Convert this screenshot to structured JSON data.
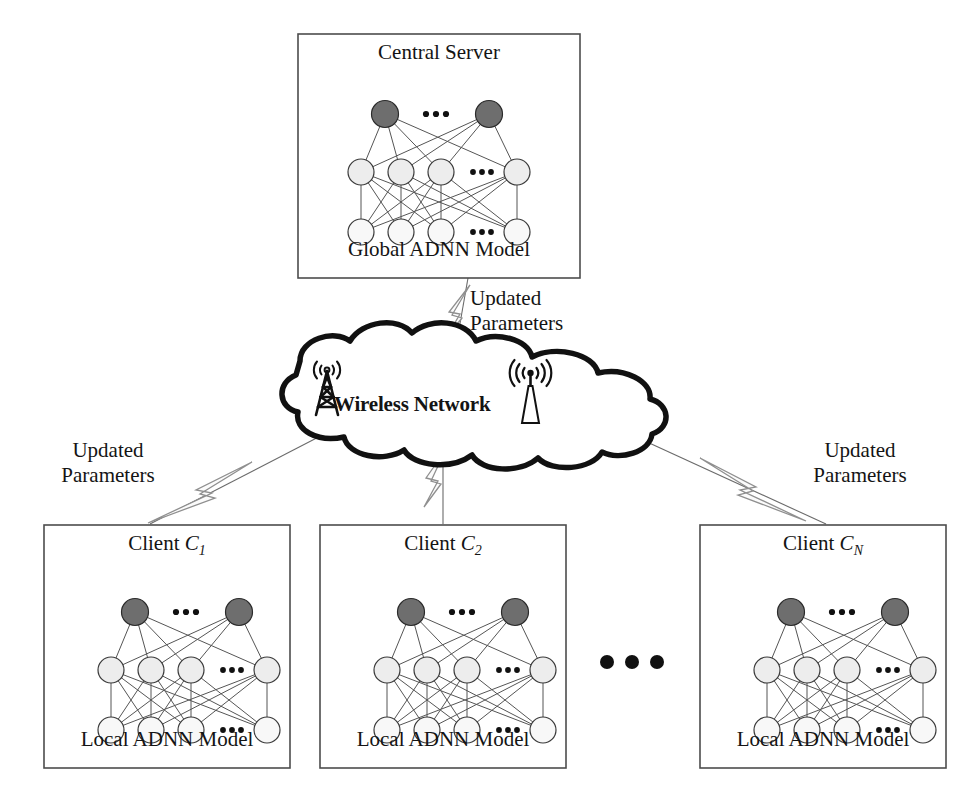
{
  "diagram": {
    "title_semantic": "federated-learning-over-wireless-network",
    "colors": {
      "stroke": "#1a1a1a",
      "box_border": "#4a4a4a",
      "node_dark": "#6e6e6e",
      "node_light": "#ececec",
      "node_lighter": "#f7f7f7",
      "bolt_stroke": "#8a8a8a",
      "link_stroke": "#555555",
      "background": "#ffffff"
    }
  },
  "server": {
    "title": "Central Server",
    "caption": "Global ADNN Model",
    "ellipsis": "•••"
  },
  "network": {
    "label": "Wireless Network",
    "tower_lattice_icon": "cell-tower-icon",
    "tower_mast_icon": "antenna-mast-icon",
    "cloud_icon": "cloud-shape-icon"
  },
  "links": {
    "to_server": {
      "label_line1": "Updated",
      "label_line2": "Parameters",
      "bolt_icon": "lightning-bolt-icon"
    },
    "to_client_1": {
      "label_line1": "Updated",
      "label_line2": "Parameters",
      "bolt_icon": "lightning-bolt-icon"
    },
    "to_client_2": {
      "label_line1": "",
      "label_line2": "",
      "bolt_icon": "lightning-bolt-icon"
    },
    "to_client_n": {
      "label_line1": "Updated",
      "label_line2": "Parameters",
      "bolt_icon": "lightning-bolt-icon"
    }
  },
  "clients": [
    {
      "title_prefix": "Client ",
      "title_symbol": "C",
      "title_subscript": "1",
      "caption": "Local ADNN Model"
    },
    {
      "title_prefix": "Client ",
      "title_symbol": "C",
      "title_subscript": "2",
      "caption": "Local ADNN Model"
    },
    {
      "title_prefix": "Client ",
      "title_symbol": "C",
      "title_subscript": "N",
      "caption": "Local ADNN Model"
    }
  ],
  "client_ellipsis": "•••",
  "adnn": {
    "layers": [
      {
        "name": "output-layer",
        "count": 2,
        "fill": "dark"
      },
      {
        "name": "hidden-layer",
        "count": 4,
        "fill": "light"
      },
      {
        "name": "input-layer",
        "count": 4,
        "fill": "lighter"
      }
    ],
    "ellipsis": "•••"
  }
}
